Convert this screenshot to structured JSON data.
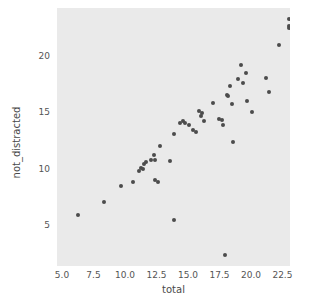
{
  "chart_data": {
    "type": "scatter",
    "title": "",
    "xlabel": "total",
    "ylabel": "not_distracted",
    "xlim": [
      4.6,
      23.1
    ],
    "ylim": [
      1.4,
      24.2
    ],
    "xticks": [
      "5.0",
      "7.5",
      "10.0",
      "12.5",
      "15.0",
      "17.5",
      "20.0",
      "22.5"
    ],
    "xtick_values": [
      5.0,
      7.5,
      10.0,
      12.5,
      15.0,
      17.5,
      20.0,
      22.5
    ],
    "yticks": [
      "5",
      "10",
      "15",
      "20"
    ],
    "ytick_values": [
      5,
      10,
      15,
      20
    ],
    "grid": false,
    "legend": null,
    "marker_color": "#4c4c4c",
    "plot_background": "#eaeaea",
    "figure_background": "#ffffff",
    "points": [
      [
        6.3,
        5.9
      ],
      [
        8.3,
        7.1
      ],
      [
        9.7,
        8.5
      ],
      [
        10.6,
        8.8
      ],
      [
        11.1,
        9.8
      ],
      [
        11.3,
        10.1
      ],
      [
        11.4,
        10.0
      ],
      [
        11.5,
        10.4
      ],
      [
        11.7,
        10.6
      ],
      [
        12.1,
        10.8
      ],
      [
        12.3,
        11.2
      ],
      [
        12.4,
        10.8
      ],
      [
        12.4,
        9.0
      ],
      [
        12.6,
        8.8
      ],
      [
        12.8,
        12.0
      ],
      [
        13.6,
        10.7
      ],
      [
        13.9,
        13.1
      ],
      [
        13.9,
        5.5
      ],
      [
        14.4,
        14.0
      ],
      [
        14.6,
        14.2
      ],
      [
        14.8,
        14.0
      ],
      [
        15.1,
        13.9
      ],
      [
        15.4,
        13.4
      ],
      [
        15.6,
        13.2
      ],
      [
        15.9,
        15.1
      ],
      [
        16.0,
        14.7
      ],
      [
        16.1,
        14.9
      ],
      [
        16.3,
        14.2
      ],
      [
        17.0,
        15.8
      ],
      [
        17.5,
        14.4
      ],
      [
        17.7,
        14.3
      ],
      [
        17.8,
        13.9
      ],
      [
        17.9,
        2.4
      ],
      [
        18.1,
        16.5
      ],
      [
        18.2,
        16.4
      ],
      [
        18.3,
        17.3
      ],
      [
        18.5,
        15.7
      ],
      [
        18.6,
        12.4
      ],
      [
        19.0,
        17.9
      ],
      [
        19.2,
        19.2
      ],
      [
        19.4,
        17.6
      ],
      [
        19.6,
        18.5
      ],
      [
        19.7,
        16.0
      ],
      [
        20.1,
        15.0
      ],
      [
        21.2,
        18.0
      ],
      [
        21.4,
        16.8
      ],
      [
        22.2,
        20.9
      ],
      [
        23.0,
        23.2
      ],
      [
        23.0,
        22.6
      ],
      [
        23.0,
        22.4
      ]
    ]
  }
}
